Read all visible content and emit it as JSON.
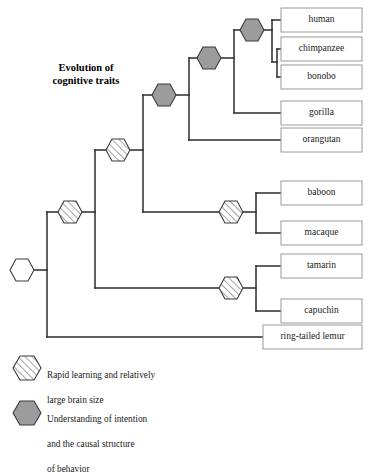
{
  "figure": {
    "title_line1": "Evolution of",
    "title_line2": "cognitive traits",
    "title": "Evolution of cognitive traits"
  },
  "taxa": [
    {
      "name": "human",
      "label": "human"
    },
    {
      "name": "chimpanzee",
      "label": "chimpanzee"
    },
    {
      "name": "bonobo",
      "label": "bonobo"
    },
    {
      "name": "gorilla",
      "label": "gorilla"
    },
    {
      "name": "orangutan",
      "label": "orangutan"
    },
    {
      "name": "baboon",
      "label": "baboon"
    },
    {
      "name": "macaque",
      "label": "macaque"
    },
    {
      "name": "tamarin",
      "label": "tamarin"
    },
    {
      "name": "capuchin",
      "label": "capuchin"
    },
    {
      "name": "ring-tailed lemur",
      "label": "ring-tailed lemur"
    }
  ],
  "legend": {
    "items": [
      {
        "marker": "hatched-hexagon",
        "text": "Rapid learning and relatively\nlarge brain size",
        "line1": "Rapid learning and relatively",
        "line2": "large brain size"
      },
      {
        "marker": "gray-hexagon",
        "text": "Understanding of intention\nand the causal structure\nof behavior",
        "line1": "Understanding of intention",
        "line2": "and the causal structure",
        "line3": "of behavior"
      }
    ]
  },
  "nodes": {
    "root": {
      "marker": "white-hexagon"
    },
    "haplorhine": {
      "marker": "hatched-hexagon"
    },
    "catarrhine": {
      "marker": "hatched-hexagon"
    },
    "hominoid": {
      "marker": "gray-hexagon"
    },
    "great-ape": {
      "marker": "gray-hexagon"
    },
    "panhomo": {
      "marker": "gray-hexagon"
    },
    "cercopithecoid": {
      "marker": "hatched-hexagon"
    },
    "platyrrhine": {
      "marker": "hatched-hexagon"
    }
  },
  "colors": {
    "branch": "#2b2b2b",
    "box_border": "#9a9a9a",
    "gray_hexagon_fill": "#9c9c9c",
    "hexagon_stroke": "#3a3a3a",
    "hatch": "#4a4a4a",
    "text": "#1a1a1a",
    "background": "#ffffff"
  }
}
